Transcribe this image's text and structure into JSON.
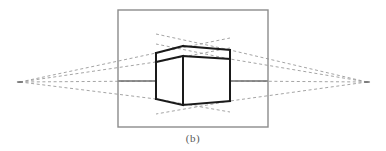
{
  "figure": {
    "caption": "(b)",
    "colors": {
      "background": "#ffffff",
      "frame_stroke": "#8c8c8c",
      "box_stroke": "#1a1a1a",
      "horizon_stroke": "#6e6e6e",
      "construction_stroke": "#9a9a9a",
      "caption_text": "#5a5a5a"
    },
    "frame": {
      "name": "picture-plane-frame",
      "x": 118,
      "y": 10,
      "width": 150,
      "height": 117,
      "stroke_width": 1.4
    },
    "horizon": {
      "name": "horizon-line",
      "y": 81,
      "left_segment": {
        "x1": 118,
        "x2": 156
      },
      "right_segment": {
        "x1": 230,
        "x2": 268
      },
      "stroke_width": 1.4
    },
    "vanishing_points": [
      {
        "name": "left-vanishing-point",
        "x": 20,
        "y": 82
      },
      {
        "name": "right-vanishing-point",
        "x": 367,
        "y": 82
      }
    ],
    "box": {
      "name": "perspective-box",
      "stroke_width": 2.0,
      "vertices": {
        "front_top": {
          "x": 183,
          "y": 46
        },
        "front_bottom": {
          "x": 183,
          "y": 105
        },
        "front_eave": {
          "x": 183,
          "y": 56
        },
        "left_top": {
          "x": 156,
          "y": 53
        },
        "left_eave": {
          "x": 156,
          "y": 62
        },
        "left_bottom": {
          "x": 156,
          "y": 99
        },
        "right_top": {
          "x": 230,
          "y": 50
        },
        "right_eave": {
          "x": 230,
          "y": 59
        },
        "right_bottom": {
          "x": 230,
          "y": 101
        }
      },
      "edges": [
        "front-vertical",
        "left-vertical",
        "right-vertical",
        "top-left-ridge",
        "top-right-ridge",
        "eave-left",
        "eave-right",
        "bottom-left",
        "bottom-right"
      ]
    },
    "construction_lines": {
      "name": "dashed-convergence-lines",
      "stroke_width": 0.9,
      "dash_pattern": "3 2.6",
      "left": [
        {
          "name": "left-line-to-top",
          "x1": 20,
          "y1": 82,
          "x2": 156,
          "y2": 53
        },
        {
          "name": "left-line-to-eave",
          "x1": 20,
          "y1": 82,
          "x2": 156,
          "y2": 62
        },
        {
          "name": "left-line-to-horizon",
          "x1": 20,
          "y1": 82,
          "x2": 156,
          "y2": 81
        },
        {
          "name": "left-line-to-bottom",
          "x1": 20,
          "y1": 82,
          "x2": 156,
          "y2": 99
        },
        {
          "name": "left-line-through-top",
          "x1": 156,
          "y1": 53,
          "x2": 230,
          "y2": 38
        },
        {
          "name": "left-line-through-eave",
          "x1": 156,
          "y1": 62,
          "x2": 230,
          "y2": 48
        },
        {
          "name": "left-line-through-bottom",
          "x1": 156,
          "y1": 99,
          "x2": 230,
          "y2": 112
        }
      ],
      "right": [
        {
          "name": "right-line-to-top",
          "x1": 367,
          "y1": 82,
          "x2": 230,
          "y2": 50
        },
        {
          "name": "right-line-to-eave",
          "x1": 367,
          "y1": 82,
          "x2": 230,
          "y2": 59
        },
        {
          "name": "right-line-to-horizon",
          "x1": 367,
          "y1": 82,
          "x2": 230,
          "y2": 81
        },
        {
          "name": "right-line-to-bottom",
          "x1": 367,
          "y1": 82,
          "x2": 230,
          "y2": 101
        },
        {
          "name": "right-line-through-top",
          "x1": 230,
          "y1": 50,
          "x2": 156,
          "y2": 34
        },
        {
          "name": "right-line-through-eave",
          "x1": 230,
          "y1": 59,
          "x2": 156,
          "y2": 44
        },
        {
          "name": "right-line-through-bottom",
          "x1": 230,
          "y1": 101,
          "x2": 156,
          "y2": 114
        }
      ]
    }
  }
}
